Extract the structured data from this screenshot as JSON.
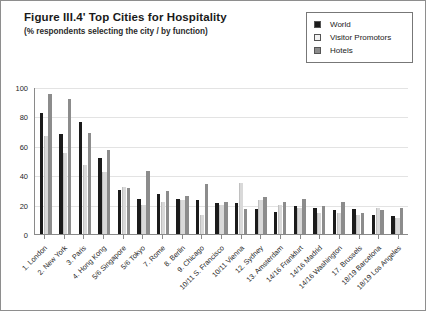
{
  "figure": {
    "title": "Figure III.4'  Top Cities for Hospitality",
    "subtitle": "(% respondents selecting the city / by function)"
  },
  "legend": {
    "position": "top-right",
    "items": [
      {
        "label": "World",
        "color": "#1b1b1b",
        "swatch_name": "legend-swatch-world"
      },
      {
        "label": "Visitor Promotors",
        "color": "#d3d3d3",
        "swatch_name": "legend-swatch-visitor-promotors"
      },
      {
        "label": "Hotels",
        "color": "#8c8c8c",
        "swatch_name": "legend-swatch-hotels"
      }
    ]
  },
  "axes": {
    "y_ticks": [
      "0",
      "20",
      "40",
      "60",
      "80",
      "100"
    ],
    "y_min": 0,
    "y_max": 100
  },
  "chart_data": {
    "type": "bar",
    "title": "Figure III.4'  Top Cities for Hospitality",
    "subtitle": "(% respondents selecting the city / by function)",
    "xlabel": "",
    "ylabel": "",
    "ylim": [
      0,
      100
    ],
    "yticks": [
      0,
      20,
      40,
      60,
      80,
      100
    ],
    "grid": true,
    "legend_position": "top-right",
    "categories": [
      "1. London",
      "2. New York",
      "3. Paris",
      "4. Hong Kong",
      "5/6 Singapore",
      "5/6 Tokyo",
      "7. Rome",
      "8. Berlin",
      "9. Chicago",
      "10/11 S. Francisco",
      "10/11 Vienna",
      "12. Sydney",
      "13. Amsterdam",
      "14/16 Frankfurt",
      "14/16 Madrid",
      "14/16 Washington",
      "17. Brussels",
      "18/19 Barcelona",
      "18/19 Los Angeles"
    ],
    "series": [
      {
        "name": "World",
        "color": "#1b1b1b",
        "values": [
          82,
          68,
          76,
          52,
          30,
          24,
          27,
          24,
          23,
          21,
          21,
          17,
          15,
          19,
          18,
          16,
          17,
          13,
          12
        ]
      },
      {
        "name": "Visitor Promotors",
        "color": "#d3d3d3",
        "values": [
          67,
          55,
          47,
          42,
          32,
          20,
          22,
          23,
          13,
          20,
          35,
          23,
          20,
          18,
          14,
          14,
          13,
          18,
          11
        ]
      },
      {
        "name": "Hotels",
        "color": "#8c8c8c",
        "values": [
          95,
          92,
          69,
          57,
          31,
          43,
          29,
          26,
          34,
          22,
          17,
          25,
          22,
          24,
          19,
          22,
          14,
          16,
          18
        ]
      }
    ]
  }
}
